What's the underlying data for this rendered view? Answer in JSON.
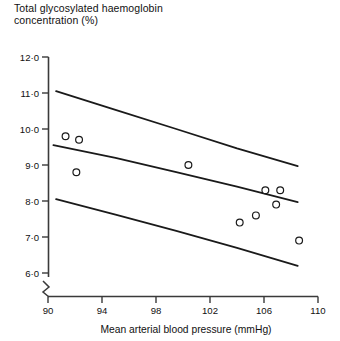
{
  "chart_data": {
    "type": "scatter",
    "title": "Total glycosylated haemoglobin concentration (%)",
    "ylabel": "Total glycosylated haemoglobin concentration (%)",
    "xlabel": "Mean arterial blood pressure (mmHg)",
    "xlim": [
      89,
      110
    ],
    "ylim": [
      5.6,
      12.0
    ],
    "grid": false,
    "legend": null,
    "axis_break": true,
    "xticks": [
      90,
      94,
      98,
      102,
      106,
      110
    ],
    "xticklabels": [
      "90",
      "94",
      "98",
      "102",
      "106",
      "110"
    ],
    "yticks": [
      6.0,
      7.0,
      8.0,
      9.0,
      10.0,
      11.0,
      12.0
    ],
    "yticklabels": [
      "6·0",
      "7·0",
      "8·0",
      "9·0",
      "10·0",
      "11·0",
      "12·0"
    ],
    "points": [
      {
        "x": 91.3,
        "y": 9.8
      },
      {
        "x": 92.3,
        "y": 9.7
      },
      {
        "x": 92.1,
        "y": 8.8
      },
      {
        "x": 100.4,
        "y": 9.0
      },
      {
        "x": 104.2,
        "y": 7.4
      },
      {
        "x": 105.4,
        "y": 7.6
      },
      {
        "x": 106.1,
        "y": 8.3
      },
      {
        "x": 107.2,
        "y": 8.3
      },
      {
        "x": 106.9,
        "y": 7.9
      },
      {
        "x": 108.6,
        "y": 6.9
      }
    ],
    "series": [
      {
        "name": "upper confidence limit",
        "type": "line",
        "x": [
          90.6,
          95.0,
          99.5,
          104.0,
          108.5
        ],
        "y": [
          11.05,
          10.53,
          10.0,
          9.46,
          8.97
        ]
      },
      {
        "name": "regression line",
        "type": "line",
        "x": [
          90.4,
          95.0,
          99.5,
          104.0,
          108.5
        ],
        "y": [
          9.55,
          9.2,
          8.8,
          8.4,
          7.97
        ]
      },
      {
        "name": "lower confidence limit",
        "type": "line",
        "x": [
          90.6,
          95.0,
          99.5,
          104.0,
          108.5
        ],
        "y": [
          8.05,
          7.62,
          7.17,
          6.7,
          6.2
        ]
      }
    ]
  },
  "marker": {
    "shape": "open-circle",
    "radius_px": 3.4,
    "stroke": "#1a1a1a",
    "fill": "#ffffff"
  },
  "style": {
    "axis_color": "#3a3a3a",
    "line_color": "#1a1a1a",
    "background": "#ffffff"
  }
}
